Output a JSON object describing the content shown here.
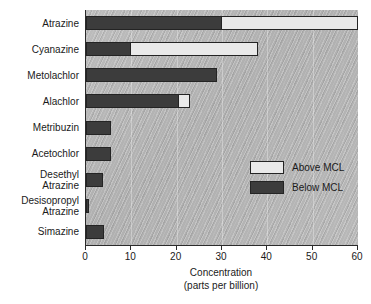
{
  "chart_data": {
    "type": "bar",
    "orientation": "horizontal",
    "stacked": true,
    "title": "",
    "xlabel": "Concentration",
    "xlabel_sub": "(parts per billion)",
    "ylabel": "",
    "xlim": [
      0,
      60
    ],
    "xticks": [
      0,
      10,
      20,
      30,
      40,
      50,
      60
    ],
    "xtick_labels": [
      "0",
      "10",
      "20",
      "30",
      "40",
      "50",
      "60"
    ],
    "grid": true,
    "legend_position": "center right (inside plot)",
    "categories": [
      "Atrazine",
      "Cyanazine",
      "Metolachlor",
      "Alachlor",
      "Metribuzin",
      "Acetochlor",
      "Desethyl\nAtrazine",
      "Desisopropyl\nAtrazine",
      "Simazine"
    ],
    "series": [
      {
        "name": "Below MCL",
        "color": "#3c3c3c",
        "values": [
          30,
          10,
          29,
          20.5,
          5.5,
          5.5,
          3.8,
          0.7,
          3.9
        ]
      },
      {
        "name": "Above MCL",
        "color": "#e9e9e9",
        "values": [
          30,
          28,
          0,
          2.5,
          0,
          0,
          0,
          0,
          0
        ]
      }
    ],
    "totals": [
      60,
      38,
      29,
      23,
      5.5,
      5.5,
      3.8,
      0.7,
      3.9
    ]
  },
  "legend": {
    "entries": [
      {
        "label": "Above MCL",
        "swatch": "above"
      },
      {
        "label": "Below MCL",
        "swatch": "below"
      }
    ]
  },
  "colors": {
    "plot_background": "#b2b2b2",
    "axis": "#2b2b2b",
    "below_mcl": "#3c3c3c",
    "above_mcl": "#e9e9e9",
    "text": "#1a1a1a",
    "page_background": "#ffffff"
  }
}
